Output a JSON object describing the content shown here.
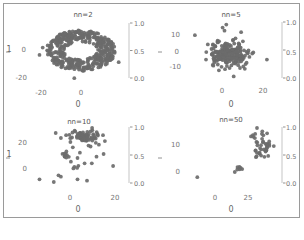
{
  "chart_data": [
    {
      "type": "scatter",
      "title": "nn=2",
      "xlabel": "0",
      "ylabel": "1",
      "xticks": [
        "-20",
        "0"
      ],
      "yticks": [
        "0",
        "-20"
      ],
      "xlim": [
        -32,
        28
      ],
      "ylim": [
        -28,
        16
      ],
      "colorbar_ticks": [
        "1.0",
        "0.5",
        "0.0"
      ],
      "colorbar_range": [
        0.0,
        1.0
      ],
      "point_color": "#6b6b6b",
      "shape": "ring",
      "ring": {
        "center": [
          0,
          -5
        ],
        "inner_radius": [
          5,
          3
        ],
        "outer_radius": [
          22,
          14
        ],
        "n": 420
      },
      "outliers": [
        [
          -24,
          -3
        ],
        [
          -26,
          -8
        ],
        [
          24,
          -13
        ],
        [
          -4,
          -24
        ]
      ]
    },
    {
      "type": "scatter",
      "title": "nn=5",
      "xlabel": "0",
      "ylabel": "",
      "xticks": [
        "0",
        "20"
      ],
      "yticks": [
        "10",
        "0",
        "-10"
      ],
      "xlim": [
        -22,
        30
      ],
      "ylim": [
        -22,
        20
      ],
      "colorbar_ticks": [
        "1.0",
        "0.5",
        "0.0"
      ],
      "colorbar_range": [
        0.0,
        1.0
      ],
      "point_color": "#6b6b6b",
      "shape": "blob",
      "blob": {
        "center": [
          3,
          -3
        ],
        "spread": [
          5,
          4
        ],
        "n": 180
      },
      "scattered": [
        [
          -15,
          10
        ],
        [
          0,
          15
        ],
        [
          1,
          13
        ],
        [
          2,
          17
        ],
        [
          10,
          12
        ],
        [
          -8,
          4
        ],
        [
          14,
          0
        ],
        [
          16,
          -2
        ],
        [
          24,
          -6
        ],
        [
          -9,
          -6
        ],
        [
          -5,
          -10
        ],
        [
          6,
          -17
        ],
        [
          12,
          -12
        ],
        [
          -2,
          -13
        ],
        [
          9,
          4
        ],
        [
          11,
          6
        ],
        [
          7,
          8
        ],
        [
          -6,
          1
        ],
        [
          -4,
          3
        ],
        [
          13,
          -8
        ]
      ]
    },
    {
      "type": "scatter",
      "title": "nn=10",
      "xlabel": "0",
      "ylabel": "1",
      "xticks": [
        "0",
        "20"
      ],
      "yticks": [
        "20",
        "0"
      ],
      "xlim": [
        -14,
        26
      ],
      "ylim": [
        -14,
        34
      ],
      "colorbar_ticks": [
        "1.0",
        "0.5",
        "0.0"
      ],
      "colorbar_range": [
        0.0,
        1.0
      ],
      "point_color": "#6b6b6b",
      "clusters": [
        {
          "center": [
            9,
            27
          ],
          "spread": [
            3.5,
            2.5
          ],
          "n": 70
        },
        {
          "center": [
            1,
            12
          ],
          "spread": [
            1.5,
            1.5
          ],
          "n": 10
        },
        {
          "center": [
            5,
            3
          ],
          "spread": [
            1,
            0.8
          ],
          "n": 4
        }
      ],
      "scattered": [
        [
          -1,
          25
        ],
        [
          -10,
          -6
        ],
        [
          -4,
          -8
        ],
        [
          -1,
          -4
        ],
        [
          -2,
          -3
        ],
        [
          6,
          -6
        ],
        [
          10,
          -7
        ],
        [
          12,
          6
        ],
        [
          14,
          11
        ],
        [
          17,
          13
        ],
        [
          21,
          4
        ],
        [
          7,
          14
        ],
        [
          4,
          18
        ],
        [
          6,
          10
        ],
        [
          9,
          6
        ],
        [
          3,
          22
        ],
        [
          15,
          20
        ]
      ]
    },
    {
      "type": "scatter",
      "title": "nn=50",
      "xlabel": "0",
      "ylabel": "",
      "xticks": [
        "0",
        "25"
      ],
      "yticks": [
        "10",
        "0"
      ],
      "xlim": [
        -32,
        56
      ],
      "ylim": [
        -8,
        22
      ],
      "colorbar_ticks": [
        "1.0",
        "0.5",
        "0.0"
      ],
      "colorbar_range": [
        0.0,
        1.0
      ],
      "point_color": "#6b6b6b",
      "clusters": [
        {
          "center": [
            42,
            12
          ],
          "spread": [
            4,
            3
          ],
          "n": 40
        },
        {
          "center": [
            34,
            18
          ],
          "spread": [
            1.5,
            1.2
          ],
          "n": 6
        },
        {
          "center": [
            19,
            2
          ],
          "spread": [
            3,
            0.7
          ],
          "n": 7
        }
      ],
      "scattered": [
        [
          -18,
          -2
        ],
        [
          47,
          8
        ]
      ]
    }
  ]
}
